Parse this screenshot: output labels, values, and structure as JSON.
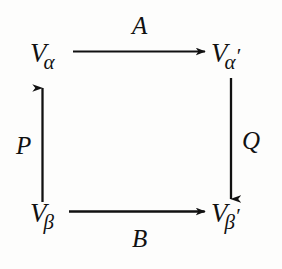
{
  "diagram": {
    "kind": "commutative-square",
    "ink_color": "#111111",
    "background_color": "#fdfdfc",
    "vertices": [
      {
        "id": "top-left",
        "base": "V",
        "subscript": "α",
        "prime": "",
        "full": "Vα"
      },
      {
        "id": "top-right",
        "base": "V",
        "subscript": "α",
        "prime": "′",
        "full": "Vα′"
      },
      {
        "id": "bottom-left",
        "base": "V",
        "subscript": "β",
        "prime": "",
        "full": "Vβ"
      },
      {
        "id": "bottom-right",
        "base": "V",
        "subscript": "β",
        "prime": "′",
        "full": "Vβ′"
      }
    ],
    "edges": [
      {
        "id": "top",
        "label": "A",
        "direction": "right",
        "from": "Vα",
        "to": "Vα′",
        "label_position": "above"
      },
      {
        "id": "bottom",
        "label": "B",
        "direction": "right",
        "from": "Vβ",
        "to": "Vβ′",
        "label_position": "below"
      },
      {
        "id": "left",
        "label": "P",
        "direction": "up",
        "from": "Vβ",
        "to": "Vα",
        "label_position": "left"
      },
      {
        "id": "right",
        "label": "Q",
        "direction": "down",
        "from": "Vα′",
        "to": "Vβ′",
        "label_position": "right"
      }
    ]
  }
}
